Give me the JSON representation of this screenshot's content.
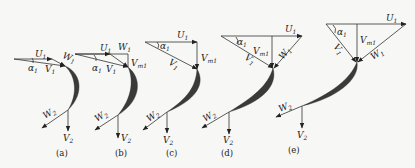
{
  "figure": {
    "panels": [
      {
        "id": "a",
        "caption": "(a)",
        "labels": {
          "U1": "U",
          "W1": "W",
          "V1": "V",
          "alpha1": "α",
          "W2": "W",
          "V2": "V"
        }
      },
      {
        "id": "b",
        "caption": "(b)",
        "labels": {
          "U1": "U",
          "W1": "W",
          "V1": "V",
          "Vm1": "V",
          "alpha1": "α",
          "W2": "W",
          "V2": "V"
        }
      },
      {
        "id": "c",
        "caption": "(c)",
        "labels": {
          "U1": "U",
          "V1": "V",
          "Vm1": "V",
          "alpha1": "α",
          "W2": "W",
          "V2": "V"
        }
      },
      {
        "id": "d",
        "caption": "(d)",
        "labels": {
          "U1": "U",
          "W1": "W",
          "V1": "V",
          "Vm1": "V",
          "alpha1": "α",
          "W2": "W",
          "V2": "V"
        }
      },
      {
        "id": "e",
        "caption": "(e)",
        "labels": {
          "U1": "U",
          "W1": "W",
          "V1": "V",
          "Vm1": "V",
          "alpha1": "α",
          "W2": "W",
          "V2": "V"
        }
      }
    ],
    "subscripts": {
      "one": "1",
      "two": "2",
      "m1": "m1"
    }
  }
}
